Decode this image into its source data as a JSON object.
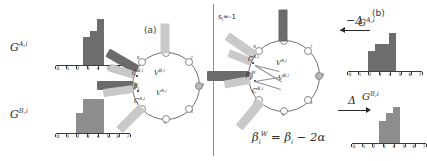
{
  "figure": {
    "divider": true,
    "accent_dark": "#6b6b6b",
    "accent_light": "#c9c9c9"
  },
  "panel_a": {
    "tag": "(a)",
    "histograms": [
      {
        "name": "hist-a-top",
        "label_base": "G",
        "label_sup": "A,i",
        "tick_labels": [
          "0",
          "1",
          "2",
          "3",
          "4",
          "5",
          "6",
          "7"
        ],
        "values": [
          0,
          0,
          0,
          28,
          34,
          46,
          0,
          0
        ],
        "bar_color": "#6d6d6d"
      },
      {
        "name": "hist-a-bottom",
        "label_base": "G",
        "label_sup": "B,i",
        "tick_labels": [
          "0",
          "1",
          "2",
          "3",
          "4",
          "5",
          "6",
          "7"
        ],
        "values": [
          0,
          0,
          20,
          34,
          34,
          34,
          0,
          0
        ],
        "bar_color": "#8d8d8d"
      }
    ],
    "ring": {
      "node_numbers": [
        "1",
        "2",
        "3",
        "4",
        "5",
        "6",
        "7",
        "8"
      ],
      "labels": [
        {
          "name": "label-C-Bi",
          "base": "C",
          "sup": "B,i"
        },
        {
          "name": "label-V-Bi",
          "base": "V",
          "sup": "B,i"
        },
        {
          "name": "label-beta-i",
          "base": "β",
          "sub": "i"
        },
        {
          "name": "label-V-Ai",
          "base": "V",
          "sup": "A,i"
        },
        {
          "name": "label-C-Ai",
          "base": "C",
          "sup": "A,i"
        }
      ]
    }
  },
  "panel_b": {
    "tag": "(b)",
    "state_label": {
      "base": "s",
      "sub": "i",
      "rest": "=-1"
    },
    "formula": {
      "lhs_base": "β",
      "lhs_sub": "i",
      "lhs_sup": "W",
      "eq": "=",
      "rhs_base": "β",
      "rhs_sub": "i",
      "minus": "−",
      "rhs_term": "2α"
    },
    "arrows": [
      {
        "name": "arrow-minus-delta",
        "direction": "left",
        "text": "−Δ"
      },
      {
        "name": "arrow-plus-delta",
        "direction": "right",
        "text": "Δ"
      }
    ],
    "histograms": [
      {
        "name": "hist-b-top",
        "label_base": "G",
        "label_sup": "A,i",
        "tick_labels": [
          "0",
          "1",
          "2",
          "3",
          "4",
          "5",
          "6",
          "7"
        ],
        "values": [
          0,
          0,
          20,
          27,
          27,
          38,
          0,
          0
        ],
        "bar_color": "#6d6d6d"
      },
      {
        "name": "hist-b-bottom",
        "label_base": "G",
        "label_sup": "B,i",
        "tick_labels": [
          "0",
          "1",
          "2",
          "3",
          "4",
          "5",
          "6",
          "7"
        ],
        "values": [
          0,
          0,
          0,
          22,
          30,
          36,
          0,
          0
        ],
        "bar_color": "#8d8d8d"
      }
    ],
    "ring": {
      "node_numbers": [
        "1",
        "2",
        "3",
        "4",
        "5",
        "6",
        "7",
        "8"
      ],
      "labels": [
        {
          "name": "label-C-Ai",
          "base": "C",
          "sup": "A,i"
        },
        {
          "name": "label-V-Ai",
          "base": "V",
          "sup": "A,i"
        },
        {
          "name": "label-beta-W",
          "base": "β",
          "sub": "i",
          "sup": "W"
        },
        {
          "name": "label-V-Bi",
          "base": "V",
          "sup": "B,i"
        },
        {
          "name": "label-C-Bi",
          "base": "C",
          "sup": "B,i"
        }
      ]
    }
  }
}
